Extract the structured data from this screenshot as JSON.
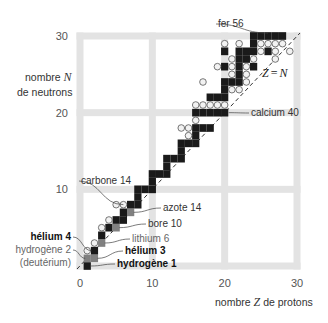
{
  "chart_data": {
    "type": "scatter",
    "title": "",
    "xlabel": "nombre Z de protons",
    "xlabel_parts": {
      "pre": "nombre ",
      "var": "Z",
      "post": " de protons"
    },
    "ylabel_line1_pre": "nombre ",
    "ylabel_var": "N",
    "ylabel_line2": "de neutrons",
    "xlim": [
      0,
      30
    ],
    "ylim": [
      0,
      30
    ],
    "xticks": [
      0,
      10,
      20,
      30
    ],
    "yticks": [
      10,
      20,
      30
    ],
    "grid": true,
    "diagonal_label": "Z = N",
    "diagonal_label_parts": {
      "left": "Z",
      "eq": "=",
      "right": "N"
    },
    "legend": "none",
    "series": [
      {
        "name": "stable",
        "marker": "black-square",
        "points": [
          [
            1,
            0
          ],
          [
            1,
            1
          ],
          [
            2,
            1
          ],
          [
            2,
            2
          ],
          [
            3,
            3
          ],
          [
            3,
            4
          ],
          [
            4,
            5
          ],
          [
            5,
            5
          ],
          [
            5,
            6
          ],
          [
            6,
            6
          ],
          [
            6,
            7
          ],
          [
            7,
            7
          ],
          [
            7,
            8
          ],
          [
            8,
            8
          ],
          [
            8,
            9
          ],
          [
            8,
            10
          ],
          [
            9,
            10
          ],
          [
            10,
            10
          ],
          [
            10,
            11
          ],
          [
            10,
            12
          ],
          [
            11,
            12
          ],
          [
            12,
            12
          ],
          [
            12,
            13
          ],
          [
            12,
            14
          ],
          [
            13,
            14
          ],
          [
            14,
            14
          ],
          [
            14,
            15
          ],
          [
            14,
            16
          ],
          [
            15,
            16
          ],
          [
            16,
            16
          ],
          [
            16,
            17
          ],
          [
            16,
            18
          ],
          [
            16,
            20
          ],
          [
            17,
            18
          ],
          [
            17,
            20
          ],
          [
            18,
            18
          ],
          [
            18,
            20
          ],
          [
            18,
            22
          ],
          [
            19,
            20
          ],
          [
            19,
            22
          ],
          [
            20,
            20
          ],
          [
            20,
            22
          ],
          [
            20,
            23
          ],
          [
            20,
            24
          ],
          [
            20,
            26
          ],
          [
            20,
            28
          ],
          [
            21,
            24
          ],
          [
            22,
            24
          ],
          [
            22,
            25
          ],
          [
            22,
            26
          ],
          [
            22,
            27
          ],
          [
            22,
            28
          ],
          [
            23,
            27
          ],
          [
            23,
            28
          ],
          [
            24,
            26
          ],
          [
            24,
            28
          ],
          [
            24,
            29
          ],
          [
            24,
            30
          ],
          [
            25,
            30
          ],
          [
            26,
            28
          ],
          [
            26,
            30
          ],
          [
            27,
            30
          ],
          [
            28,
            30
          ]
        ]
      },
      {
        "name": "unstable",
        "marker": "open-circle",
        "points": [
          [
            1,
            2
          ],
          [
            2,
            3
          ],
          [
            3,
            5
          ],
          [
            4,
            6
          ],
          [
            5,
            8
          ],
          [
            6,
            8
          ],
          [
            14,
            18
          ],
          [
            15,
            18
          ],
          [
            15,
            17
          ],
          [
            16,
            19
          ],
          [
            19,
            21
          ],
          [
            20,
            21
          ],
          [
            21,
            25
          ],
          [
            21,
            26
          ],
          [
            21,
            27
          ],
          [
            21,
            23
          ],
          [
            22,
            23
          ],
          [
            23,
            25
          ],
          [
            23,
            26
          ],
          [
            24,
            27
          ],
          [
            25,
            28
          ],
          [
            25,
            29
          ],
          [
            26,
            29
          ],
          [
            27,
            29
          ],
          [
            27,
            28
          ],
          [
            28,
            29
          ],
          [
            29,
            28
          ],
          [
            22,
            29
          ],
          [
            20,
            29
          ],
          [
            19,
            26
          ],
          [
            18,
            21
          ],
          [
            17,
            24
          ],
          [
            17,
            21
          ],
          [
            16,
            21
          ],
          [
            27,
            27
          ],
          [
            23,
            24
          ]
        ]
      },
      {
        "name": "highlighted",
        "marker": "gray-square",
        "points": [
          [
            1,
            1
          ],
          [
            2,
            1
          ],
          [
            3,
            3
          ],
          [
            5,
            5
          ],
          [
            7,
            7
          ]
        ]
      }
    ],
    "annotations": [
      {
        "text": "fer 56",
        "Z": 26,
        "N": 30,
        "weight": "normal"
      },
      {
        "text": "calcium 40",
        "Z": 20,
        "N": 20,
        "weight": "normal"
      },
      {
        "text": "carbone 14",
        "Z": 6,
        "N": 8,
        "weight": "normal"
      },
      {
        "text": "azote 14",
        "Z": 7,
        "N": 7,
        "weight": "normal"
      },
      {
        "text": "bore 10",
        "Z": 5,
        "N": 5,
        "weight": "normal"
      },
      {
        "text": "lithium 6",
        "Z": 3,
        "N": 3,
        "weight": "light"
      },
      {
        "text": "hélium 4",
        "Z": 2,
        "N": 2,
        "weight": "bold"
      },
      {
        "text": "hélium 3",
        "Z": 2,
        "N": 1,
        "weight": "bold"
      },
      {
        "text": "hydrogène 2",
        "Z": 1,
        "N": 1,
        "weight": "light"
      },
      {
        "text": "(deutérium)",
        "Z": 1,
        "N": 1,
        "weight": "light"
      },
      {
        "text": "hydrogène 1",
        "Z": 1,
        "N": 0,
        "weight": "bold"
      }
    ]
  },
  "colors": {
    "grid": "#e3e3e3",
    "stable": "#1a1a1a",
    "highlight": "#808080",
    "circle_fill": "#f2f2f2",
    "circle_stroke": "#555555",
    "diag": "#333333"
  }
}
